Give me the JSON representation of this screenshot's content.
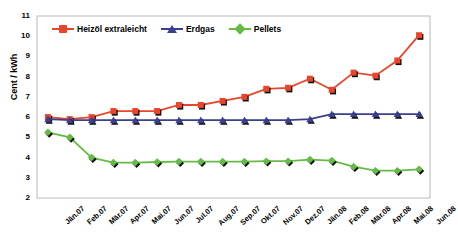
{
  "chart_data": {
    "type": "line",
    "title": "",
    "xlabel": "",
    "ylabel": "Cent / kWh",
    "ylim": [
      2,
      11
    ],
    "yticks": [
      2,
      3,
      4,
      5,
      6,
      7,
      8,
      9,
      10,
      11
    ],
    "grid": false,
    "legend_position": "top-inside-left",
    "categories": [
      "Jän.07",
      "Feb.07",
      "Mär.07",
      "Apr.07",
      "Mai.07",
      "Jun.07",
      "Jul.07",
      "Aug.07",
      "Sep.07",
      "Okt.07",
      "Nov.07",
      "Dez.07",
      "Jän.08",
      "Feb.08",
      "Mär.08",
      "Apr.08",
      "Mai.08",
      "Jun.08"
    ],
    "series": [
      {
        "name": "Heizöl extraleicht",
        "color": "#E8462B",
        "marker": "square",
        "values": [
          6.0,
          5.9,
          6.0,
          6.3,
          6.3,
          6.3,
          6.6,
          6.6,
          6.8,
          7.0,
          7.4,
          7.45,
          7.9,
          7.35,
          8.2,
          8.05,
          8.8,
          10.05
        ]
      },
      {
        "name": "Erdgas",
        "color": "#3B3F8F",
        "marker": "triangle",
        "values": [
          5.9,
          5.85,
          5.85,
          5.85,
          5.85,
          5.85,
          5.85,
          5.85,
          5.85,
          5.85,
          5.85,
          5.85,
          5.9,
          6.15,
          6.15,
          6.15,
          6.15,
          6.15
        ]
      },
      {
        "name": "Pellets",
        "color": "#64BC46",
        "marker": "diamond",
        "values": [
          5.25,
          5.0,
          4.0,
          3.75,
          3.75,
          3.78,
          3.8,
          3.8,
          3.8,
          3.8,
          3.82,
          3.82,
          3.9,
          3.85,
          3.55,
          3.35,
          3.35,
          3.42
        ]
      }
    ]
  },
  "axis": {
    "y_title": "Cent / kWh"
  }
}
